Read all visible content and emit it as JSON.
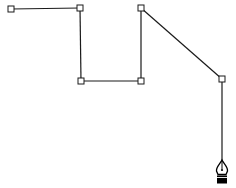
{
  "canvas": {
    "width": 236,
    "height": 188,
    "background": "#ffffff"
  },
  "path": {
    "stroke_color": "#1a1a1a",
    "stroke_width": 1.2,
    "anchor_size": 6,
    "anchor_fill": "#ffffff",
    "anchor_stroke": "#1a1a1a",
    "anchors": [
      {
        "x": 11,
        "y": 9
      },
      {
        "x": 80,
        "y": 8
      },
      {
        "x": 81,
        "y": 81
      },
      {
        "x": 141,
        "y": 81
      },
      {
        "x": 141,
        "y": 8
      },
      {
        "x": 222,
        "y": 79
      }
    ],
    "rubber_band_end": {
      "x": 222,
      "y": 160
    }
  },
  "cursor": {
    "tool": "pen-tool-icon",
    "x": 222,
    "y": 160,
    "color": "#000000"
  }
}
